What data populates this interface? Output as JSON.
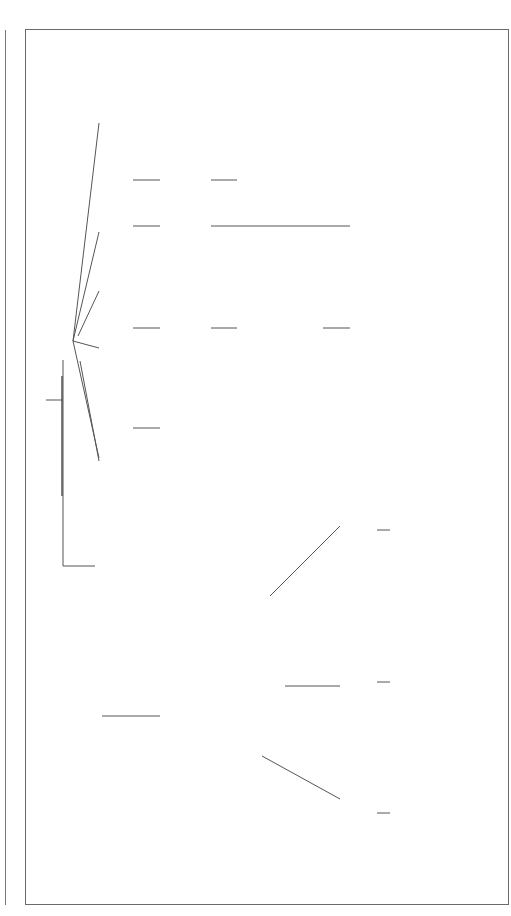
{
  "center": {
    "label": "Weather"
  },
  "definitions": {
    "weather_title": "Weather",
    "weather_text": "Condition of air around earth daily",
    "climate_title": "Climate",
    "climate_text_1": "The average weather of a region over",
    "climate_text_2": "a long period of time"
  },
  "weather_conditions": {
    "label": "Weather Conditions",
    "branches": [
      {
        "label": "Temperature",
        "detail": [
          "Thermometer",
          "Fahrenheit",
          "Celsius"
        ]
      },
      {
        "label": "Winds",
        "detail": [
          "Anemometer"
        ],
        "patterns": {
          "title": "Patterns",
          "items": [
            "Trade Winds",
            "Prevailing",
            "Westerly",
            "Polar",
            "Easterlies"
          ]
        },
        "local": [
          "Monsoons",
          "Mountain Winds",
          "Sea Breezes",
          "Land Breezes",
          "Jet Streams"
        ]
      },
      {
        "label": "Air Pressure",
        "detail": [
          "Cold Fronts",
          "Warm Fronts"
        ],
        "storms": {
          "title": "Types of Storms",
          "items": [
            "Blizzards",
            "Hurricanes",
            "Tornadoes",
            "Thunderstorms"
          ]
        }
      },
      {
        "label": "Water Vapor",
        "detail": [
          "Humidity",
          "Rel. Humidity",
          "Psychrometer"
        ],
        "precip": [
          "Frost",
          "Hail",
          "Rain",
          "Sleet"
        ]
      }
    ]
  },
  "atmosphere": {
    "label": "Atmosphere",
    "items": [
      "Exosphere",
      "Thermosphere",
      "Mesosphere",
      "Stratosphere",
      "Troposphere"
    ]
  },
  "clouds": {
    "label": "Clouds",
    "items": [
      "Cumulus",
      "Stratus",
      "Cirro",
      "Alto",
      "Cirrus",
      "Nimbus"
    ]
  },
  "meteorology": {
    "title": "Meteorology",
    "subtitle": "Study of Weather",
    "items": [
      "Forecasts",
      "Satellites",
      "Radar",
      "Computers"
    ]
  },
  "colors": {
    "line": "#555555",
    "shadow": "#b8b8b8",
    "frame": "#6a6a6a"
  }
}
